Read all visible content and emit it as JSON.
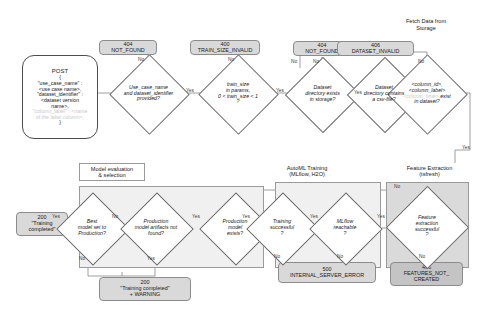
{
  "diagram": {
    "colors": {
      "pill_fill": "#d9d9d9",
      "group_fill": "#f0f0f0",
      "group_fill_dark": "#dadada",
      "stroke": "#6b6b6b",
      "faint_text": "#c9c9c9"
    }
  },
  "labels": {
    "fetch_data": "Fetch Data from\nStorage",
    "model_eval": "Model evaluation\n& selection",
    "automl": "AutoML Training\n(MLflow, H2O)",
    "feature_extraction": "Feature Extraction\n(tsfresh)"
  },
  "request": {
    "title": "POST",
    "brace_open": "{",
    "lines": [
      "\"use_case_name\" :",
      "<use case name>,",
      "\"dataset_identifier\" :",
      "<dataset version",
      "name>,"
    ],
    "faint_lines": [
      "\"column_label\" : <name",
      "of the label column>,"
    ],
    "brace_close": "}"
  },
  "pills": [
    {
      "id": "not-found-1",
      "code": "404",
      "msg": "NOT_FOUND"
    },
    {
      "id": "train-size-invalid",
      "code": "400",
      "msg": "TRAIN_SIZE_INVALID"
    },
    {
      "id": "not-found-2",
      "code": "404",
      "msg": "NOT_FOUND"
    },
    {
      "id": "dataset-invalid",
      "code": "406",
      "msg": "DATASET_INVALID"
    },
    {
      "id": "training-completed",
      "code": "200",
      "msg": "\"Training\ncompleted\""
    },
    {
      "id": "training-completed-warning",
      "code": "200",
      "msg": "\"Training completed\"\n+ WARNING"
    },
    {
      "id": "internal-server-error",
      "code": "500",
      "msg": "INTERNAL_SERVER_ERROR"
    },
    {
      "id": "features-not-created",
      "code": "406",
      "msg": "FEATURES_NOT_\nCREATED"
    }
  ],
  "decisions": [
    {
      "id": "params-provided",
      "lines": [
        "Use_case_name",
        "and dataset_identifier",
        "provided?"
      ]
    },
    {
      "id": "train-size-valid",
      "lines": [
        "train_size",
        "in params,",
        "0 < train_size < 1",
        "?"
      ]
    },
    {
      "id": "dataset-dir-exists",
      "lines": [
        "Dataset",
        "directory exists",
        "in storage?"
      ]
    },
    {
      "id": "dataset-has-csv",
      "lines": [
        "Dataset",
        "directory contains",
        "a csv-file?"
      ]
    },
    {
      "id": "columns-exist",
      "lines": [
        "<column_id>,",
        "<column_label>"
      ],
      "faint_line": "<column_time>",
      "tail_italic": "exist",
      "last_line": "in dataset?"
    },
    {
      "id": "best-model-production",
      "lines": [
        "Best",
        "model set to",
        "Production?"
      ]
    },
    {
      "id": "production-artifacts-missing",
      "lines": [
        "Production",
        "model artifacts not",
        "found?"
      ]
    },
    {
      "id": "production-model-exists",
      "lines": [
        "Production",
        "model",
        "exists?"
      ]
    },
    {
      "id": "training-successful",
      "lines": [
        "Training",
        "successful",
        "?"
      ]
    },
    {
      "id": "mlflow-reachable",
      "lines": [
        "MLflow",
        "reachable",
        "?"
      ]
    },
    {
      "id": "feature-extraction-successful",
      "lines": [
        "Feature",
        "extraction",
        "successful",
        "?"
      ]
    }
  ],
  "edges": {
    "no": "No",
    "yes": "Yes"
  }
}
